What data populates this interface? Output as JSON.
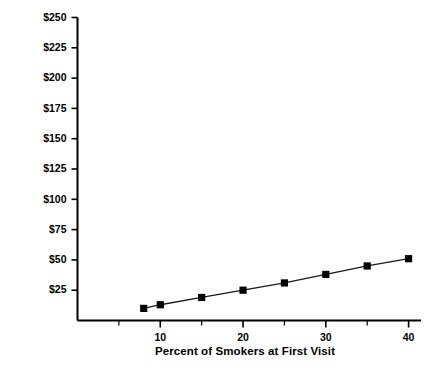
{
  "chart_data": {
    "type": "line",
    "title": "",
    "subtitle": "",
    "xlabel": "Percent of Smokers at First Visit",
    "ylabel": "Break-Even Cost",
    "xlim": [
      0,
      41.5
    ],
    "ylim": [
      0,
      250
    ],
    "grid": false,
    "legend": null,
    "x_ticks": [
      10,
      20,
      30,
      40
    ],
    "x_tick_labels": [
      "10",
      "20",
      "30",
      "40"
    ],
    "x_minor_ticks": [
      5,
      15,
      25,
      35
    ],
    "y_ticks": [
      25,
      50,
      75,
      100,
      125,
      150,
      175,
      200,
      225,
      250
    ],
    "y_tick_labels": [
      "$25",
      "$50",
      "$75",
      "$100",
      "$125",
      "$150",
      "$175",
      "$200",
      "$225",
      "$250"
    ],
    "marker": "square",
    "marker_color": "#000000",
    "line_color": "#1a1a1a",
    "x": [
      8,
      10,
      15,
      20,
      25,
      30,
      35,
      40
    ],
    "values": [
      10,
      13,
      19,
      25,
      31,
      38,
      45,
      51
    ],
    "series": [
      {
        "name": "Break-Even Cost",
        "x": [
          8,
          10,
          15,
          20,
          25,
          30,
          35,
          40
        ],
        "values": [
          10,
          13,
          19,
          25,
          31,
          38,
          45,
          51
        ]
      }
    ]
  }
}
